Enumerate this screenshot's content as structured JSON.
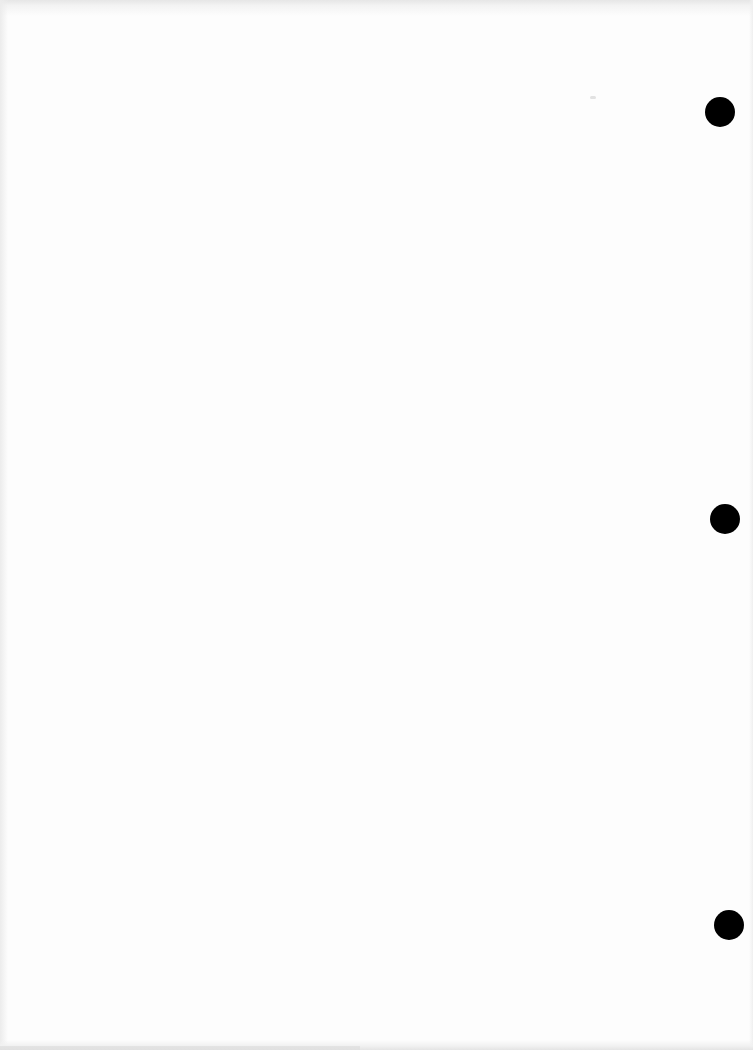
{
  "document": {
    "type": "blank scanned page",
    "text": "",
    "background_color": "#fdfdfd"
  },
  "punch_holes": [
    {
      "cx": 720,
      "cy": 112,
      "r": 15,
      "color": "#000000"
    },
    {
      "cx": 725,
      "cy": 519,
      "r": 15,
      "color": "#000000"
    },
    {
      "cx": 729,
      "cy": 925,
      "r": 15,
      "color": "#000000"
    }
  ]
}
